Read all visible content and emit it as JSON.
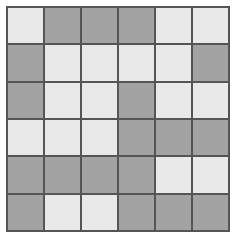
{
  "figure": {
    "type": "grid-pattern",
    "rows": 6,
    "columns": 6,
    "cell_count": 36
  },
  "palette": {
    "light": "#e9e9e9",
    "dark": "#a3a3a3",
    "gridline": "#555555",
    "background": "#ffffff"
  },
  "legend": {
    "light_label": "light",
    "dark_label": "dark"
  },
  "grid": {
    "cells": [
      [
        "light",
        "dark",
        "dark",
        "dark",
        "light",
        "light"
      ],
      [
        "dark",
        "light",
        "light",
        "light",
        "light",
        "dark"
      ],
      [
        "dark",
        "light",
        "light",
        "dark",
        "light",
        "light"
      ],
      [
        "light",
        "light",
        "light",
        "dark",
        "dark",
        "dark"
      ],
      [
        "dark",
        "dark",
        "dark",
        "dark",
        "light",
        "light"
      ],
      [
        "dark",
        "light",
        "light",
        "dark",
        "dark",
        "dark"
      ]
    ],
    "counts": {
      "light": 18,
      "dark": 18
    }
  }
}
